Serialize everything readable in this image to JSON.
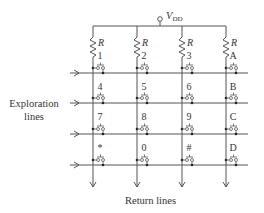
{
  "supply": {
    "label": "V",
    "subscript": "DD"
  },
  "resistor_label": "R",
  "columns": [
    {
      "x": 93
    },
    {
      "x": 137
    },
    {
      "x": 182
    },
    {
      "x": 226
    }
  ],
  "rows": [
    {
      "y": 73
    },
    {
      "y": 103
    },
    {
      "y": 134
    },
    {
      "y": 165
    }
  ],
  "keys": [
    [
      "1",
      "2",
      "3",
      "A"
    ],
    [
      "4",
      "5",
      "6",
      "B"
    ],
    [
      "7",
      "8",
      "9",
      "C"
    ],
    [
      "*",
      "0",
      "#",
      "D"
    ]
  ],
  "labels": {
    "exploration_line1": "Exploration",
    "exploration_line2": "lines",
    "return_lines": "Return lines"
  },
  "colors": {
    "line": "#555555",
    "dot": "#222222",
    "text": "#333333"
  }
}
